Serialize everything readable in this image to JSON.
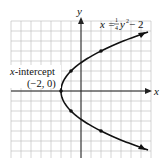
{
  "chart_data": {
    "type": "line",
    "title": "",
    "equation": "x = 1/4 y^2 - 2",
    "xlabel": "x",
    "ylabel": "y",
    "xlim": [
      -7,
      7
    ],
    "ylim": [
      -7,
      7
    ],
    "grid": true,
    "grid_step": 1,
    "series": [
      {
        "name": "x = 1/4 y^2 - 2",
        "points": [
          {
            "x": 6.4,
            "y": -5.9
          },
          {
            "x": 2,
            "y": -4
          },
          {
            "x": -1,
            "y": -2
          },
          {
            "x": -2,
            "y": 0
          },
          {
            "x": -1,
            "y": 2
          },
          {
            "x": 2,
            "y": 4
          },
          {
            "x": 6.4,
            "y": 5.9
          }
        ],
        "marked_points": [
          {
            "x": -2,
            "y": 0
          },
          {
            "x": -1,
            "y": 2
          },
          {
            "x": -1,
            "y": -2
          },
          {
            "x": 2,
            "y": 4
          },
          {
            "x": 2,
            "y": -4
          }
        ]
      }
    ],
    "annotations": [
      {
        "text": "x-intercept",
        "at": {
          "x": -2,
          "y": 0
        }
      },
      {
        "text": "(−2, 0)",
        "at": {
          "x": -2,
          "y": 0
        }
      }
    ]
  },
  "labels": {
    "x_axis": "x",
    "y_axis": "y",
    "equation_lhs": "x = ",
    "equation_num": "1",
    "equation_den": "4",
    "equation_rest": "y",
    "equation_exp": "2",
    "equation_tail": " − 2",
    "intercept_title_var": "x",
    "intercept_title_rest": "-intercept",
    "intercept_coords": "(−2, 0)"
  }
}
